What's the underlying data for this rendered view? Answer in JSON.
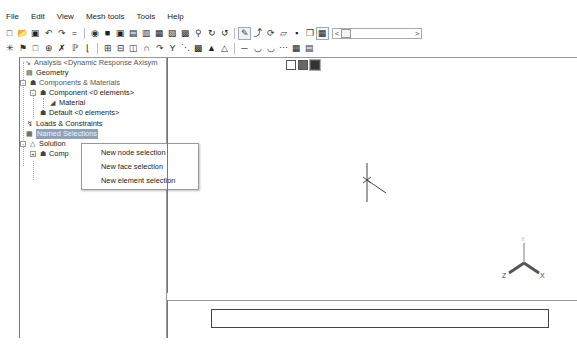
{
  "menu": [
    "File",
    "Edit",
    "View",
    "Mesh tools",
    "Tools",
    "Help"
  ],
  "toolbar1": {
    "icons": [
      "new-file-icon",
      "open-icon",
      "save-icon",
      "undo-icon",
      "redo-icon",
      "equals-icon",
      "view-iso-icon",
      "view-front-icon",
      "view-back-icon",
      "view-left-icon",
      "view-right-icon",
      "view-top-icon",
      "view-bottom-icon",
      "zoom-fit-icon",
      "zoom-icon",
      "rotate-icon",
      "rotate-reverse-icon",
      "select-icon",
      "pointer-dropdown-icon",
      "rotate-view-icon",
      "plane-icon",
      "shaded-icon",
      "box-icon",
      "grid-icon"
    ],
    "slider": {
      "left": "<",
      "right": ">"
    }
  },
  "toolbar2": {
    "icons": [
      "explode-icon",
      "hierarchy-icon",
      "square-icon",
      "circle-target-icon",
      "cross-icon",
      "node-tree-icon",
      "bracket-icon",
      "link-icon",
      "link2-icon",
      "cylinder-icon",
      "arch-icon",
      "curve-icon",
      "y-icon",
      "dots-icon",
      "mesh-icon",
      "warning-icon",
      "triangle-icon",
      "line-icon",
      "bowl-icon",
      "bowl2-icon",
      "table-icon",
      "table2-icon"
    ]
  },
  "tree": {
    "items": [
      {
        "label": "Analysis <Dynamic Response Axisym",
        "icon": "analysis-icon",
        "style": "gray"
      },
      {
        "label": "Geometry",
        "icon": "geometry-icon",
        "style": "normal"
      },
      {
        "label": "Components & Materials",
        "icon": "components-icon",
        "style": "gray"
      },
      {
        "label": "Component <0 elements>",
        "icon": "component-icon",
        "style": "normal"
      },
      {
        "label": "Material",
        "icon": "material-icon",
        "style": "normal"
      },
      {
        "label": "Default <0 elements>",
        "icon": "component-icon",
        "style": "normal"
      },
      {
        "label": "Loads & Constraints",
        "icon": "loads-icon",
        "style": "normal"
      },
      {
        "label": "Named Selections",
        "icon": "named-selection-icon",
        "style": "selected"
      },
      {
        "label": "Solution",
        "icon": "solution-icon",
        "style": "normal"
      },
      {
        "label": "Comp",
        "icon": "component-icon",
        "style": "normal"
      }
    ]
  },
  "context_menu": {
    "items": [
      "New node selection",
      "New face selection",
      "New element selection"
    ]
  },
  "viewport": {
    "view_buttons": [
      "wireframe-view-icon",
      "shaded-view-icon",
      "solid-view-icon"
    ],
    "axes": {
      "x": "X",
      "y": "Y",
      "z": "Z"
    }
  },
  "command_box": {
    "value": ""
  }
}
